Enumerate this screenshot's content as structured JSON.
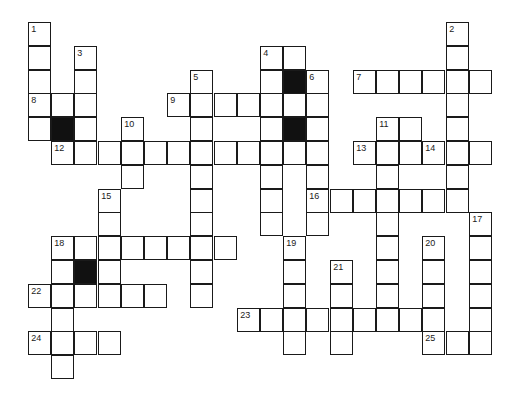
{
  "puzzle": {
    "type": "crossword",
    "grid": {
      "origin_x": 29,
      "origin_y": 23,
      "col_pitch": 23.2,
      "row_pitch": 23.8
    },
    "colors": {
      "line": "#1a1a1a",
      "black_square": "#111111",
      "background": "#ffffff"
    },
    "words": [
      {
        "num": 1,
        "dir": "down",
        "row": 0,
        "col": 0,
        "len": 5
      },
      {
        "num": 2,
        "dir": "down",
        "row": 0,
        "col": 18,
        "len": 8
      },
      {
        "num": 3,
        "dir": "down",
        "row": 1,
        "col": 2,
        "len": 5
      },
      {
        "num": 4,
        "dir": "down",
        "row": 1,
        "col": 10,
        "len": 8
      },
      {
        "num": 4,
        "dir": "across",
        "row": 1,
        "col": 10,
        "len": 2
      },
      {
        "num": 5,
        "dir": "down",
        "row": 2,
        "col": 7,
        "len": 10
      },
      {
        "num": 6,
        "dir": "down",
        "row": 2,
        "col": 12,
        "len": 7
      },
      {
        "num": 7,
        "dir": "across",
        "row": 2,
        "col": 14,
        "len": 6
      },
      {
        "num": 8,
        "dir": "across",
        "row": 3,
        "col": 0,
        "len": 3
      },
      {
        "num": 9,
        "dir": "across",
        "row": 3,
        "col": 6,
        "len": 7
      },
      {
        "num": 10,
        "dir": "down",
        "row": 4,
        "col": 4,
        "len": 3
      },
      {
        "num": 11,
        "dir": "down",
        "row": 4,
        "col": 15,
        "len": 9
      },
      {
        "num": 11,
        "dir": "across",
        "row": 4,
        "col": 15,
        "len": 2
      },
      {
        "num": null,
        "dir": "down",
        "row": 4,
        "col": 16,
        "len": 2
      },
      {
        "num": 12,
        "dir": "across",
        "row": 5,
        "col": 1,
        "len": 12
      },
      {
        "num": 13,
        "dir": "across",
        "row": 5,
        "col": 14,
        "len": 2
      },
      {
        "num": 14,
        "dir": "across",
        "row": 5,
        "col": 17,
        "len": 3
      },
      {
        "num": 15,
        "dir": "down",
        "row": 7,
        "col": 3,
        "len": 5
      },
      {
        "num": 16,
        "dir": "across",
        "row": 7,
        "col": 12,
        "len": 7
      },
      {
        "num": 17,
        "dir": "down",
        "row": 8,
        "col": 19,
        "len": 6
      },
      {
        "num": 18,
        "dir": "across",
        "row": 9,
        "col": 1,
        "len": 8
      },
      {
        "num": 18,
        "dir": "down",
        "row": 9,
        "col": 1,
        "len": 6
      },
      {
        "num": 19,
        "dir": "down",
        "row": 9,
        "col": 11,
        "len": 5
      },
      {
        "num": 20,
        "dir": "down",
        "row": 9,
        "col": 17,
        "len": 5
      },
      {
        "num": 21,
        "dir": "down",
        "row": 10,
        "col": 13,
        "len": 4
      },
      {
        "num": 22,
        "dir": "across",
        "row": 11,
        "col": 0,
        "len": 6
      },
      {
        "num": 23,
        "dir": "across",
        "row": 12,
        "col": 9,
        "len": 9
      },
      {
        "num": 24,
        "dir": "across",
        "row": 13,
        "col": 0,
        "len": 4
      },
      {
        "num": 25,
        "dir": "across",
        "row": 13,
        "col": 17,
        "len": 3
      }
    ],
    "black_squares": [
      {
        "row": 2,
        "col": 11
      },
      {
        "row": 4,
        "col": 11
      },
      {
        "row": 4,
        "col": 1
      },
      {
        "row": 10,
        "col": 2
      }
    ],
    "numbers": [
      {
        "label": "1",
        "row": 0,
        "col": 0
      },
      {
        "label": "2",
        "row": 0,
        "col": 18
      },
      {
        "label": "3",
        "row": 1,
        "col": 2
      },
      {
        "label": "4",
        "row": 1,
        "col": 10
      },
      {
        "label": "5",
        "row": 2,
        "col": 7
      },
      {
        "label": "6",
        "row": 2,
        "col": 12
      },
      {
        "label": "7",
        "row": 2,
        "col": 14
      },
      {
        "label": "8",
        "row": 3,
        "col": 0
      },
      {
        "label": "9",
        "row": 3,
        "col": 6
      },
      {
        "label": "10",
        "row": 4,
        "col": 4
      },
      {
        "label": "11",
        "row": 4,
        "col": 15
      },
      {
        "label": "12",
        "row": 5,
        "col": 1
      },
      {
        "label": "13",
        "row": 5,
        "col": 14
      },
      {
        "label": "14",
        "row": 5,
        "col": 17
      },
      {
        "label": "15",
        "row": 7,
        "col": 3
      },
      {
        "label": "16",
        "row": 7,
        "col": 12
      },
      {
        "label": "17",
        "row": 8,
        "col": 19
      },
      {
        "label": "18",
        "row": 9,
        "col": 1
      },
      {
        "label": "19",
        "row": 9,
        "col": 11
      },
      {
        "label": "20",
        "row": 9,
        "col": 17
      },
      {
        "label": "21",
        "row": 10,
        "col": 13
      },
      {
        "label": "22",
        "row": 11,
        "col": 0
      },
      {
        "label": "23",
        "row": 12,
        "col": 9
      },
      {
        "label": "24",
        "row": 13,
        "col": 0
      },
      {
        "label": "25",
        "row": 13,
        "col": 17
      }
    ]
  }
}
